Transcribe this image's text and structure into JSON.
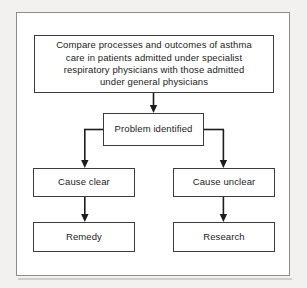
{
  "figure": {
    "kind": "flowchart",
    "title_text": "",
    "frame": {
      "border_color": "#8e8d8b",
      "background": "#ffffff"
    },
    "page_background": "#f2f1ef",
    "line_color": "#1c1c1c"
  },
  "nodes": {
    "compare": {
      "id": "compare",
      "label": "Compare processes and outcomes of asthma\ncare in patients admitted  under specialist\nrespiratory physicians with those admitted\nunder general physicians"
    },
    "problem": {
      "id": "problem",
      "label": "Problem identified"
    },
    "cause_clear": {
      "id": "cause-clear",
      "label": "Cause clear"
    },
    "cause_unclear": {
      "id": "cause-unclear",
      "label": "Cause unclear"
    },
    "remedy": {
      "id": "remedy",
      "label": "Remedy"
    },
    "research": {
      "id": "research",
      "label": "Research"
    }
  },
  "edges": [
    {
      "from": "compare",
      "to": "problem",
      "style": "straight-down",
      "label": ""
    },
    {
      "from": "problem",
      "to": "cause_clear",
      "style": "elbow-left-down",
      "label": ""
    },
    {
      "from": "problem",
      "to": "cause_unclear",
      "style": "elbow-right-down",
      "label": ""
    },
    {
      "from": "cause_clear",
      "to": "remedy",
      "style": "straight-down",
      "label": ""
    },
    {
      "from": "cause_unclear",
      "to": "research",
      "style": "straight-down",
      "label": ""
    }
  ]
}
